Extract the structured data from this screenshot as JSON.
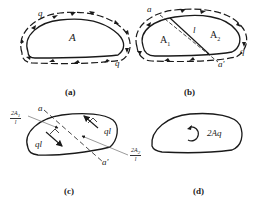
{
  "panels": {
    "a": {
      "caption": "(a)",
      "area_label": "A",
      "flow_labels": [
        "q",
        "q"
      ]
    },
    "b": {
      "caption": "(b)",
      "cut_start": "a",
      "cut_end": "a'",
      "length_label": "l",
      "area1_label": "A",
      "area1_sub": "1",
      "area2_label": "A",
      "area2_sub": "2",
      "flow_label": "q"
    },
    "c": {
      "caption": "(c)",
      "cut_start": "a",
      "cut_end": "a'",
      "force_left": "ql",
      "force_right": "ql",
      "arm_left_num": "2A",
      "arm_left_sub": "1",
      "arm_left_den": "l",
      "arm_right_num": "2A",
      "arm_right_sub": "2",
      "arm_right_den": "l"
    },
    "d": {
      "caption": "(d)",
      "torque_label": "2Aq"
    }
  },
  "colors": {
    "line": "#1a1a1a",
    "background": "#ffffff"
  }
}
